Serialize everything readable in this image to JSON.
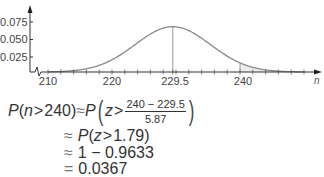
{
  "chart_data": {
    "type": "line",
    "title": "",
    "xlabel": "n",
    "ylabel": "",
    "distribution": "normal",
    "mean": 229.5,
    "std_dev": 5.87,
    "xlim": [
      207,
      252
    ],
    "ylim": [
      0,
      0.09
    ],
    "x_ticks_labeled": [
      210,
      220,
      229.5,
      240
    ],
    "x_tick_labels": [
      "210",
      "220",
      "229.5",
      "240"
    ],
    "x_minor_tick_step": 2,
    "y_ticks": [
      0.025,
      0.05,
      0.075
    ],
    "y_tick_labels": [
      "0.025",
      "0.050",
      "0.075"
    ],
    "vertical_markers": [
      229.5,
      240
    ],
    "shaded_region": {
      "from": 240,
      "to": "right tail",
      "description": "P(n > 240)"
    },
    "axis_break": true,
    "grid": false,
    "peak_value": 0.068
  },
  "chart": {
    "y_labels": [
      "0.075",
      "0.050",
      "0.025"
    ],
    "x_labels": [
      "210",
      "220",
      "229.5",
      "240"
    ],
    "x_axis_variable": "n"
  },
  "math": {
    "line1": {
      "lhs_P": "P",
      "lhs_open": "(",
      "lhs_var": "n",
      "lhs_gt": ">",
      "lhs_val": "240",
      "lhs_close": ")",
      "approx": "≈",
      "rhs_P": "P",
      "rhs_var": "z",
      "rhs_gt": ">",
      "numerator": "240 − 229.5",
      "denominator": "5.87"
    },
    "line2": {
      "approx": "≈",
      "text_P": "P",
      "open": "(",
      "var": "z",
      "gt": ">",
      "val": "1.79)"
    },
    "line3": {
      "approx": "≈",
      "expr": "1 − 0.9633"
    },
    "line4": {
      "eq": "=",
      "result": "0.0367"
    }
  }
}
